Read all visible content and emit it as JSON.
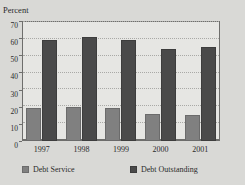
{
  "figure": {
    "cut_title": "",
    "background_color": "#d9d9d6",
    "plot_background_color": "#e6e6e3"
  },
  "chart_data": {
    "type": "bar",
    "title": "",
    "subtitle": "",
    "xlabel": "",
    "ylabel": "Percent",
    "categories": [
      "1997",
      "1998",
      "1999",
      "2000",
      "2001"
    ],
    "series": [
      {
        "name": "Debt Service",
        "color": "#808080",
        "values": [
          19.5,
          20.0,
          19.0,
          16.0,
          15.2
        ]
      },
      {
        "name": "Debt Outstanding",
        "color": "#4a4a4a",
        "values": [
          59.2,
          60.5,
          58.8,
          53.8,
          55.0
        ]
      }
    ],
    "ylim": [
      0,
      70
    ],
    "yticks": [
      0,
      10,
      20,
      30,
      40,
      50,
      60,
      70
    ],
    "ytick_labels": [
      "0",
      "10",
      "20",
      "30",
      "40",
      "50",
      "60",
      "70"
    ],
    "grid": true,
    "grid_style": "dotted-horizontal",
    "legend_position": "bottom"
  }
}
